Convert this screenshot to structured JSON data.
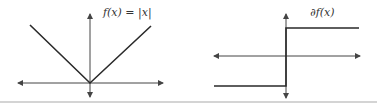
{
  "left_plot": {
    "label": "f(x) = |x|",
    "function": "absolute value",
    "axes": {
      "x_range_px": [
        18,
        163
      ],
      "y_axis_x_px": 90,
      "x_axis_y_px": 83
    },
    "points": [
      [
        30,
        25
      ],
      [
        90,
        83
      ],
      [
        151,
        26
      ]
    ]
  },
  "right_plot": {
    "label": "∂f(x)",
    "function": "subdifferential of |x| (sign step)",
    "axes": {
      "x_range_px": [
        214,
        360
      ],
      "y_axis_x_px": 286,
      "x_axis_y_px": 56
    },
    "points": [
      [
        214,
        86
      ],
      [
        286,
        86
      ],
      [
        286,
        28
      ],
      [
        359,
        28
      ]
    ]
  },
  "colors": {
    "line": "#2a2a2a",
    "axis": "#444444",
    "background": "#ffffff"
  }
}
